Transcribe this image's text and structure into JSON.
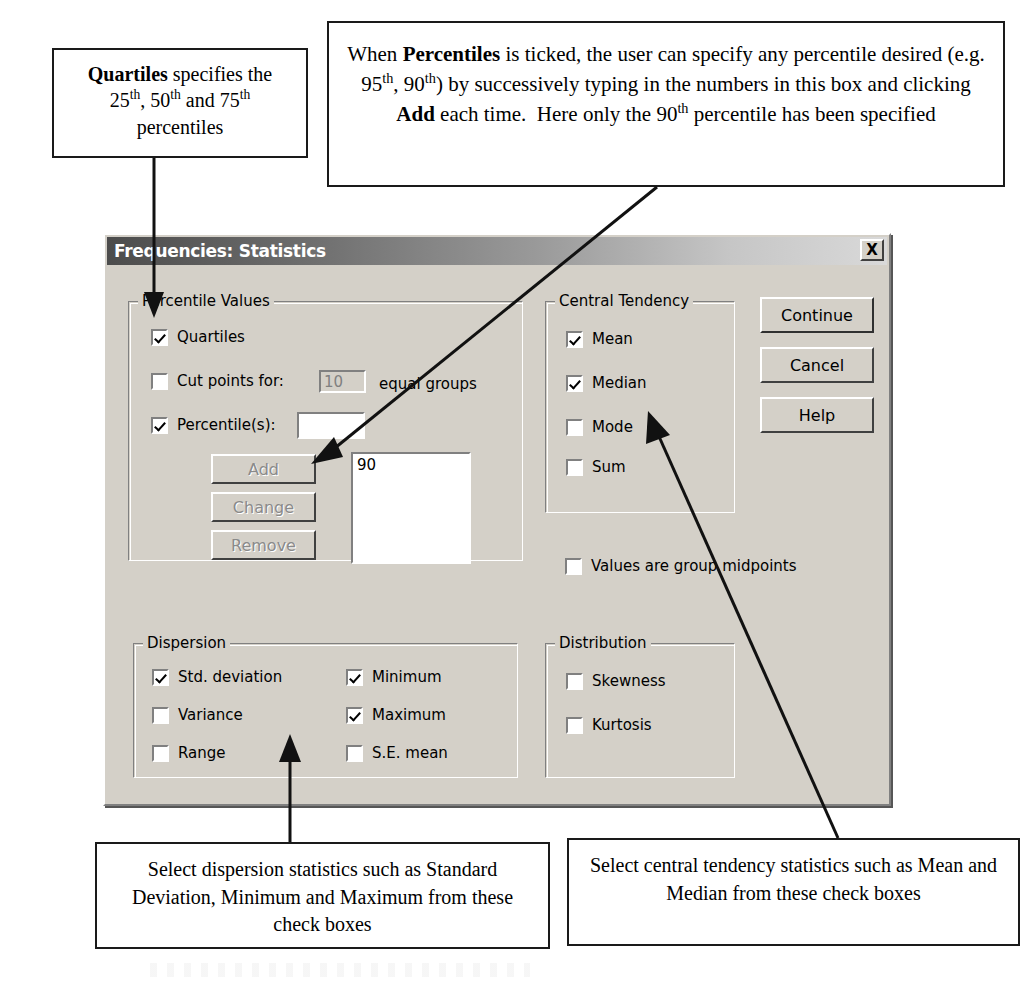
{
  "annotations": {
    "quartiles": {
      "name": "quartiles-callout",
      "line1_bold": "Quartiles",
      "line1_rest": " specifies the",
      "line2": "25th, 50th and 75th",
      "line3": "percentiles"
    },
    "percentiles": {
      "name": "percentiles-callout",
      "seg1": "When ",
      "seg2_bold": "Percentiles",
      "seg3": " is ticked, the user can specify any percentile desired (e.g. 95th, 90th) by successively typing in the numbers in this box and clicking ",
      "seg4_bold": "Add",
      "seg5": " each time.  Here only the 90th percentile has been specified"
    },
    "dispersion": {
      "name": "dispersion-callout",
      "text": "Select dispersion statistics such as Standard Deviation, Minimum and Maximum from these check boxes"
    },
    "central": {
      "name": "central-tendency-callout",
      "text": "Select central tendency statistics such as Mean and Median from these check boxes"
    }
  },
  "dialog": {
    "title": "Frequencies: Statistics",
    "close_label": "X",
    "groups": {
      "percentile_values": {
        "caption": "Percentile Values",
        "quartiles": {
          "label": "Quartiles",
          "checked": true
        },
        "cut_points": {
          "label": "Cut points for:",
          "checked": false,
          "value": "10",
          "suffix": "equal groups",
          "enabled": false
        },
        "percentiles": {
          "label": "Percentile(s):",
          "checked": true,
          "value": ""
        },
        "buttons": [
          {
            "label": "Add",
            "enabled": false
          },
          {
            "label": "Change",
            "enabled": false
          },
          {
            "label": "Remove",
            "enabled": false
          }
        ],
        "list_items": [
          "90"
        ]
      },
      "central_tendency": {
        "caption": "Central Tendency",
        "items": [
          {
            "label": "Mean",
            "checked": true
          },
          {
            "label": "Median",
            "checked": true
          },
          {
            "label": "Mode",
            "checked": false
          },
          {
            "label": "Sum",
            "checked": false
          }
        ]
      },
      "dispersion": {
        "caption": "Dispersion",
        "left_items": [
          {
            "label": "Std. deviation",
            "checked": true
          },
          {
            "label": "Variance",
            "checked": false
          },
          {
            "label": "Range",
            "checked": false
          }
        ],
        "right_items": [
          {
            "label": "Minimum",
            "checked": true
          },
          {
            "label": "Maximum",
            "checked": true
          },
          {
            "label": "S.E. mean",
            "checked": false
          }
        ]
      },
      "distribution": {
        "caption": "Distribution",
        "items": [
          {
            "label": "Skewness",
            "checked": false
          },
          {
            "label": "Kurtosis",
            "checked": false
          }
        ]
      }
    },
    "values_are_group_midpoints": {
      "label": "Values are group midpoints",
      "checked": false
    },
    "action_buttons": [
      {
        "label": "Continue",
        "default": true
      },
      {
        "label": "Cancel",
        "default": false
      },
      {
        "label": "Help",
        "default": false
      }
    ]
  },
  "colors": {
    "dialog_face": "#d4d0c8",
    "titlebar_dark": "#4c4c4c",
    "titlebar_light": "#d9d9d9",
    "shadow": "#808080",
    "highlight": "#ffffff",
    "disabled_text": "#8a8a8a",
    "annotation_border": "#1a1a1a"
  }
}
